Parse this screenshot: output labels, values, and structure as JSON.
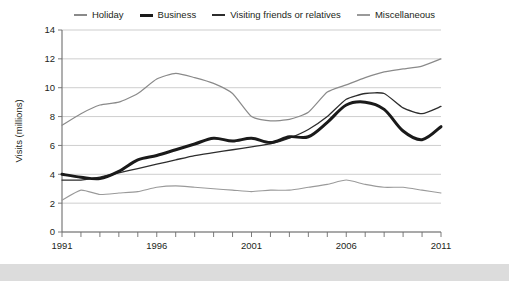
{
  "chart_data": {
    "type": "line",
    "title": "",
    "xlabel": "",
    "ylabel": "Visits (millions)",
    "xlim": [
      1991,
      2011
    ],
    "ylim": [
      0,
      14
    ],
    "yticks": [
      0,
      2,
      4,
      6,
      8,
      10,
      12,
      14
    ],
    "xticks": [
      1991,
      1992,
      1993,
      1994,
      1995,
      1996,
      1997,
      1998,
      1999,
      2000,
      2001,
      2002,
      2003,
      2004,
      2005,
      2006,
      2007,
      2008,
      2009,
      2010,
      2011
    ],
    "xtick_labels": [
      "1991",
      "",
      "",
      "",
      "",
      "1996",
      "",
      "",
      "",
      "",
      "2001",
      "",
      "",
      "",
      "",
      "2006",
      "",
      "",
      "",
      "",
      "2011"
    ],
    "grid": "horizontal",
    "legend_position": "top-center",
    "x": [
      1991,
      1992,
      1993,
      1994,
      1995,
      1996,
      1997,
      1998,
      1999,
      2000,
      2001,
      2002,
      2003,
      2004,
      2005,
      2006,
      2007,
      2008,
      2009,
      2010,
      2011
    ],
    "series": [
      {
        "name": "Holiday",
        "color": "#8a8a8a",
        "width": 1.2,
        "values": [
          7.4,
          8.2,
          8.8,
          9.0,
          9.6,
          10.6,
          11.0,
          10.7,
          10.3,
          9.6,
          8.0,
          7.7,
          7.8,
          8.3,
          9.7,
          10.2,
          10.7,
          11.1,
          11.3,
          11.5,
          12.0
        ]
      },
      {
        "name": "Business",
        "color": "#1a1a1a",
        "width": 3.0,
        "values": [
          4.0,
          3.8,
          3.7,
          4.2,
          5.0,
          5.3,
          5.7,
          6.1,
          6.5,
          6.3,
          6.5,
          6.2,
          6.6,
          6.6,
          7.6,
          8.8,
          9.0,
          8.5,
          7.0,
          6.4,
          7.3
        ]
      },
      {
        "name": "Visiting friends or relatives",
        "color": "#2d2d2d",
        "width": 1.3,
        "values": [
          3.6,
          3.6,
          3.8,
          4.1,
          4.4,
          4.7,
          5.0,
          5.3,
          5.5,
          5.7,
          5.9,
          6.1,
          6.5,
          7.1,
          8.0,
          9.2,
          9.6,
          9.6,
          8.6,
          8.2,
          8.7
        ]
      },
      {
        "name": "Miscellaneous",
        "color": "#9a9a9a",
        "width": 1.1,
        "values": [
          2.2,
          2.9,
          2.6,
          2.7,
          2.8,
          3.1,
          3.2,
          3.1,
          3.0,
          2.9,
          2.8,
          2.9,
          2.9,
          3.1,
          3.3,
          3.6,
          3.3,
          3.1,
          3.1,
          2.9,
          2.7
        ]
      }
    ]
  },
  "legend": {
    "items": [
      {
        "label": "Holiday"
      },
      {
        "label": "Business"
      },
      {
        "label": "Visiting friends or relatives"
      },
      {
        "label": "Miscellaneous"
      }
    ]
  },
  "caption": {
    "text": ""
  }
}
